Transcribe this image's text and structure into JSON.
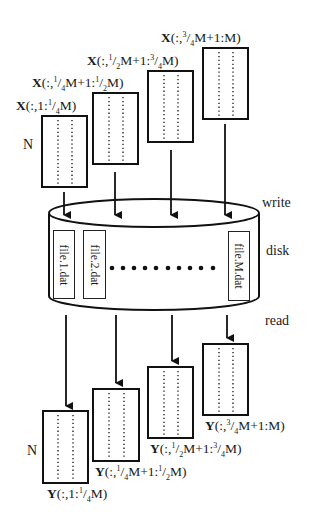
{
  "diagram": {
    "row_label": "N",
    "stage_labels": {
      "write": "write",
      "disk": "disk",
      "read": "read"
    },
    "input_blocks": [
      {
        "var": "X",
        "range_pre": "(:,1:",
        "frac1": [
          "1",
          "4"
        ],
        "range_mid": "M",
        "frac2": null,
        "range_post": ")"
      },
      {
        "var": "X",
        "text": "(:,¹/₄M+1:¹/₂M)"
      },
      {
        "var": "X",
        "text": "(:,¹/₂M+1:³/₄M)"
      },
      {
        "var": "X",
        "text": "(:,³/₄M+1:M)"
      }
    ],
    "output_blocks": [
      {
        "var": "Y",
        "text": "(:,1:¹/₄M)"
      },
      {
        "var": "Y",
        "text": "(:,¹/₄M+1:¹/₂M)"
      },
      {
        "var": "Y",
        "text": "(:,¹/₂M+1:³/₄M)"
      },
      {
        "var": "Y",
        "text": "(:,³/₄M+1:M)"
      }
    ],
    "files": [
      "file.1.dat",
      "file.2.dat",
      "file.M.dat"
    ],
    "ellipsis_dots": 10
  }
}
